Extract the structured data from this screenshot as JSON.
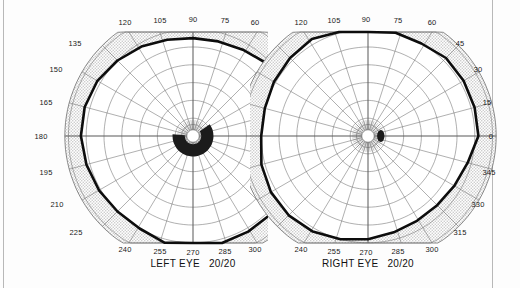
{
  "document": {
    "type": "visual-field-perimetry-chart",
    "page_background": "#ffffff",
    "border_color": "#b8b8b8"
  },
  "charts": [
    {
      "id": "left-eye",
      "caption_eye": "LEFT EYE",
      "caption_acuity": "20/20",
      "side": "left",
      "outer_labels_top": [
        "120",
        "105",
        "90",
        "75",
        "60"
      ],
      "outer_labels_side": [
        "135",
        "150",
        "165",
        "180",
        "195",
        "210",
        "225"
      ],
      "outer_labels_bottom": [
        "240",
        "255",
        "270",
        "285",
        "300"
      ],
      "blind_spot": {
        "shape": "crescent",
        "description": "enlarged arcuate scotoma wrapping inferior-nasal around fixation",
        "fill": "#1b1b1b"
      }
    },
    {
      "id": "right-eye",
      "caption_eye": "RIGHT EYE",
      "caption_acuity": "20/20",
      "side": "right",
      "outer_labels_top": [
        "120",
        "105",
        "90",
        "75",
        "60"
      ],
      "outer_labels_side": [
        "45",
        "30",
        "15",
        "0",
        "345",
        "330",
        "315"
      ],
      "outer_labels_bottom": [
        "240",
        "255",
        "270",
        "285",
        "300"
      ],
      "blind_spot": {
        "shape": "oval",
        "description": "normal physiologic blind spot temporal to fixation",
        "fill": "#1b1b1b"
      }
    }
  ],
  "chart_data": {
    "type": "line",
    "title": "",
    "xlabel": "",
    "ylabel": "",
    "coordinate_system": "polar",
    "angular_unit": "degrees",
    "radial_unit": "degrees of eccentricity",
    "grid": true,
    "legend_position": "none",
    "radial_rings": [
      10,
      20,
      30,
      40,
      50,
      60,
      70,
      80,
      90
    ],
    "spoke_interval_deg": 15,
    "series": [
      {
        "name": "left-eye-isopter",
        "angles": [
          0,
          15,
          30,
          45,
          60,
          75,
          90,
          105,
          120,
          135,
          150,
          165,
          180,
          195,
          210,
          225,
          240,
          255,
          270,
          285,
          300,
          315,
          330,
          345
        ],
        "values": [
          62,
          62,
          60,
          58,
          56,
          55,
          55,
          56,
          58,
          60,
          62,
          63,
          63,
          62,
          61,
          60,
          60,
          62,
          63,
          63,
          62,
          62,
          62,
          62
        ]
      },
      {
        "name": "right-eye-isopter",
        "angles": [
          0,
          15,
          30,
          45,
          60,
          75,
          90,
          105,
          120,
          135,
          150,
          165,
          180,
          195,
          210,
          225,
          240,
          255,
          270,
          285,
          300,
          315,
          330,
          345
        ],
        "values": [
          62,
          62,
          62,
          62,
          60,
          60,
          62,
          63,
          63,
          62,
          61,
          60,
          60,
          62,
          63,
          63,
          62,
          60,
          58,
          56,
          55,
          55,
          56,
          58
        ]
      }
    ],
    "colors": {
      "isopter": "#0d0d0d",
      "grid": "#6e6e6e",
      "shading": "#cfcfcf",
      "scotoma": "#1b1b1b"
    }
  }
}
